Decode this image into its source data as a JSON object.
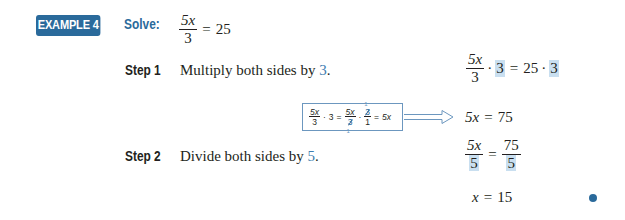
{
  "example": {
    "badge": "EXAMPLE 4",
    "solve_label": "Solve:",
    "equation": {
      "numerator": "5x",
      "denominator": "3",
      "equals": "=",
      "rhs": "25"
    }
  },
  "steps": [
    {
      "label": "Step 1",
      "description_prefix": "Multiply both sides by ",
      "description_value": "3",
      "description_suffix": ".",
      "work": {
        "numerator": "5x",
        "denominator": "3",
        "mult": "·",
        "factor": "3",
        "equals": "=",
        "rhs": "25",
        "rhs_factor": "3"
      },
      "callout": {
        "frac1_num": "5x",
        "frac1_den": "3",
        "mult": "·",
        "factor": "3",
        "eq1": "=",
        "frac2_num": "5x",
        "frac2_den": "3",
        "frac3_num": "3",
        "frac3_den": "1",
        "cancel_top": "1",
        "cancel_bottom": "1",
        "eq2": "=",
        "result": "5x"
      },
      "result": {
        "lhs": "5x",
        "equals": "=",
        "rhs": "75"
      }
    },
    {
      "label": "Step 2",
      "description_prefix": "Divide both sides by ",
      "description_value": "5",
      "description_suffix": ".",
      "work": {
        "lhs_num": "5x",
        "lhs_den": "5",
        "equals": "=",
        "rhs_num": "75",
        "rhs_den": "5"
      },
      "result": {
        "lhs": "x",
        "equals": "=",
        "rhs": "15"
      }
    }
  ],
  "colors": {
    "accent": "#2a6a9b",
    "highlight": "#c9dff0",
    "callout_border": "#6c97bf",
    "text": "#231f20"
  }
}
